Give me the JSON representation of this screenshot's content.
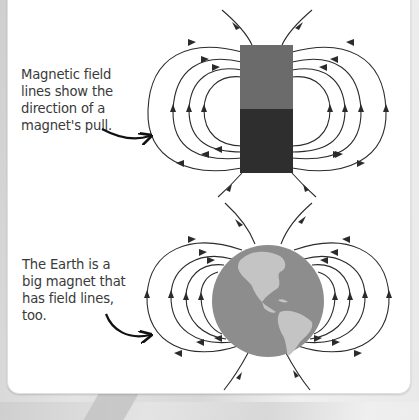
{
  "diagram": {
    "top_panel": {
      "caption": "Magnetic field lines show the direction of a magnet's pull.",
      "subject": "bar magnet",
      "magnet_colors": {
        "top": "#6b6b6b",
        "bottom": "#2e2e2e"
      }
    },
    "bottom_panel": {
      "caption": "The Earth is a big magnet that has field lines, too.",
      "subject": "Earth globe",
      "earth_colors": {
        "ocean": "#8d8d8d",
        "land": "#c4c4c4"
      }
    },
    "line_color": "#2b2b2b",
    "icons": [
      "bar-magnet-icon",
      "earth-globe-icon",
      "field-line-arrow-icon",
      "pointer-arrow-icon"
    ]
  }
}
